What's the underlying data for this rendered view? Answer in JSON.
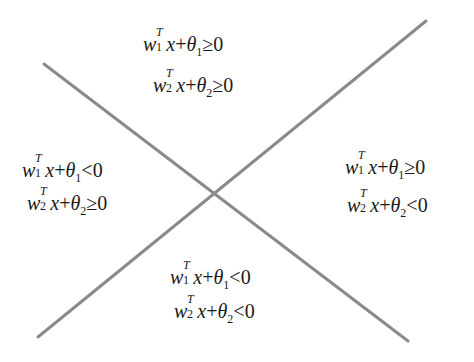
{
  "diagram": {
    "line_color": "#8a8a8a",
    "lines": [
      {
        "name": "line-1",
        "x1": 44,
        "y1": 64,
        "x2": 408,
        "y2": 341
      },
      {
        "name": "line-2",
        "x1": 38,
        "y1": 337,
        "x2": 426,
        "y2": 21
      }
    ],
    "regions": {
      "top": {
        "eq1": {
          "w": "w",
          "sub": "1",
          "sup": "T",
          "x": "x",
          "plus": "+",
          "theta": "θ",
          "tsub": "1",
          "rel": "≥",
          "rhs": "0"
        },
        "eq2": {
          "w": "w",
          "sub": "2",
          "sup": "T",
          "x": "x",
          "plus": "+",
          "theta": "θ",
          "tsub": "2",
          "rel": "≥",
          "rhs": "0"
        }
      },
      "left": {
        "eq1": {
          "w": "w",
          "sub": "1",
          "sup": "T",
          "x": "x",
          "plus": "+",
          "theta": "θ",
          "tsub": "1",
          "rel": "<",
          "rhs": "0"
        },
        "eq2": {
          "w": "w",
          "sub": "2",
          "sup": "T",
          "x": "x",
          "plus": "+",
          "theta": "θ",
          "tsub": "2",
          "rel": "≥",
          "rhs": "0"
        }
      },
      "right": {
        "eq1": {
          "w": "w",
          "sub": "1",
          "sup": "T",
          "x": "x",
          "plus": "+",
          "theta": "θ",
          "tsub": "1",
          "rel": "≥",
          "rhs": "0"
        },
        "eq2": {
          "w": "w",
          "sub": "2",
          "sup": "T",
          "x": "x",
          "plus": "+",
          "theta": "θ",
          "tsub": "2",
          "rel": "<",
          "rhs": "0"
        }
      },
      "bottom": {
        "eq1": {
          "w": "w",
          "sub": "1",
          "sup": "T",
          "x": "x",
          "plus": "+",
          "theta": "θ",
          "tsub": "1",
          "rel": "<",
          "rhs": "0"
        },
        "eq2": {
          "w": "w",
          "sub": "2",
          "sup": "T",
          "x": "x",
          "plus": "+",
          "theta": "θ",
          "tsub": "2",
          "rel": "<",
          "rhs": "0"
        }
      }
    }
  }
}
